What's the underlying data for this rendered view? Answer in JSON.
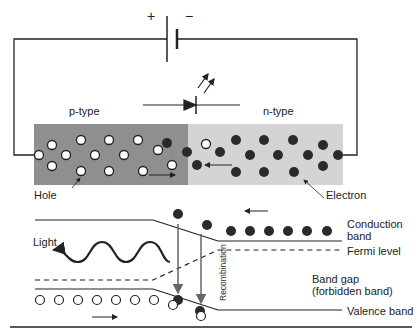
{
  "circuit": {
    "battery_plus": "+",
    "battery_minus": "−"
  },
  "junction": {
    "p_label": "p-type",
    "n_label": "n-type",
    "hole_label": "Hole",
    "electron_label": "Electron",
    "colors": {
      "p_region": "#8f8f8f",
      "n_region": "#d4d4d4",
      "electron": "#2a2a2a",
      "hole": "#ffffff"
    }
  },
  "band_diagram": {
    "light_label": "Light",
    "conduction_label_1": "Conduction",
    "conduction_label_2": "band",
    "fermi_label": "Fermi level",
    "gap_label_1": "Band gap",
    "gap_label_2": "(forbidden band)",
    "valence_label": "Valence band",
    "recombination_label": "Recombination"
  }
}
